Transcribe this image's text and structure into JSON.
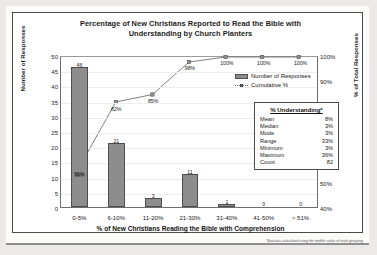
{
  "chart_data": {
    "type": "bar",
    "title": "Percentage of New Christians Reported to Read the Bible with Understanding by Church Planters",
    "title_line1": "Percentage of New Christians Reported to Read the Bible with",
    "title_line2": "Understanding by Church Planters",
    "xlabel": "% of New Christians Reading the Bible with Comprehension",
    "ylabel": "Number of Responses",
    "ylabel_right": "% of Total Responses",
    "categories": [
      "0-5%",
      "6-10%",
      "11-20%",
      "21-30%",
      "31-40%",
      "41-50%",
      "> 51%"
    ],
    "series": [
      {
        "name": "Number of Responses",
        "type": "bar",
        "values": [
          46,
          21,
          3,
          11,
          1,
          0,
          0
        ]
      },
      {
        "name": "Cumulative %",
        "type": "line",
        "values": [
          56,
          82,
          85,
          98,
          100,
          100,
          100
        ]
      }
    ],
    "bar_labels": [
      "46",
      "21",
      "3",
      "11",
      "1",
      "0",
      "0"
    ],
    "bar_inside_labels": [
      "56%",
      "",
      "",
      "",
      "",
      "",
      ""
    ],
    "cumulative_labels": [
      "56%",
      "82%",
      "85%",
      "98%",
      "100%",
      "100%",
      "100%"
    ],
    "ylim": [
      0,
      50
    ],
    "yticks": [
      "50",
      "45",
      "40",
      "35",
      "30",
      "25",
      "20",
      "15",
      "10",
      "5",
      "0"
    ],
    "ylim_right": [
      40,
      100
    ],
    "yticks_right": [
      "100%",
      "90%",
      "80%",
      "70%",
      "60%",
      "50%",
      "40%"
    ],
    "grid": true,
    "legend_position": "upper right",
    "footnote": "*Statistics calculated using the middle value of each grouping"
  },
  "legend": {
    "bar_label": "Number of Responses",
    "line_label": "Cumulative %"
  },
  "stats_box": {
    "title": "% Understanding*",
    "rows": [
      {
        "key": "Mean",
        "value": "8%"
      },
      {
        "key": "Median",
        "value": "3%"
      },
      {
        "key": "Mode",
        "value": "3%"
      },
      {
        "key": "Range",
        "value": "33%"
      },
      {
        "key": "Minimum",
        "value": "3%"
      },
      {
        "key": "Maximum",
        "value": "36%"
      },
      {
        "key": "Count",
        "value": "82"
      }
    ]
  },
  "colors": {
    "bar_fill": "#8d8d8d",
    "bar_edge": "#4d4d4d",
    "line": "#6f6f6f",
    "frame": "#4a4a4a",
    "text": "#1b1b1b"
  }
}
